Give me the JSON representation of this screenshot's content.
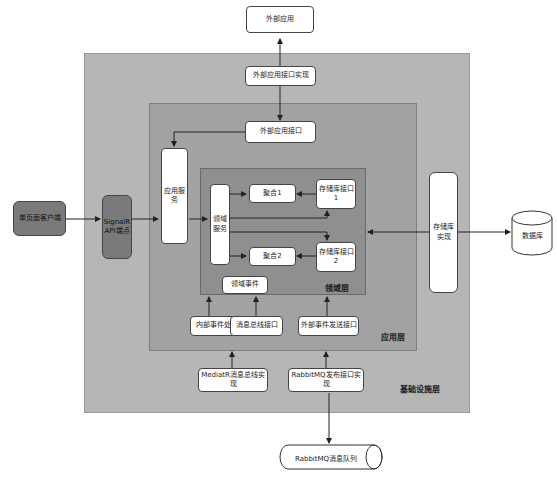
{
  "diagram": {
    "layers": {
      "infrastructure": "基础设施层",
      "application": "应用层",
      "domain": "领域层"
    },
    "nodes": {
      "external_app": "外部应用",
      "external_app_interface_impl": "外部应用接口实现",
      "external_app_interface": "外部应用接口",
      "spa_client": "单页面客户端",
      "signalr_endpoint": "SignalR API端点",
      "app_service": "应用服务",
      "domain_service": "领域服务",
      "aggregate1": "聚合1",
      "aggregate2": "聚合2",
      "repo_interface1": "存储库接口1",
      "repo_interface2": "存储库接口2",
      "domain_event": "领域事件",
      "internal_event_handling": "内部事件处理",
      "message_bus_interface": "消息总线接口",
      "external_event_send_interface": "外部事件发送接口",
      "repo_impl": "存储库实现",
      "database": "数据库",
      "mediatr_bus_impl": "MediatR消息总线实现",
      "rabbitmq_publish_impl": "RabbitMQ发布接口实现",
      "rabbitmq_queue": "RabbitMQ消息队列"
    },
    "colors": {
      "infrastructure_fill": "#b6b6b6",
      "application_fill": "#a2a2a2",
      "domain_fill": "#8f8f8f",
      "client_fill": "#7a7a7a"
    }
  }
}
